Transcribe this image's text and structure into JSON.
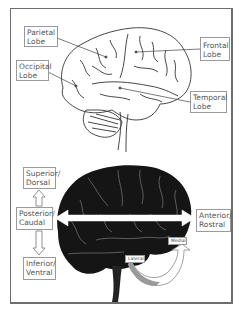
{
  "top_diagram": {
    "title": "Brain lobes (lateral view)",
    "labels": {
      "parietal": {
        "line1": "Parietal",
        "line2": "Lobe"
      },
      "occipital": {
        "line1": "Occipital",
        "line2": "Lobe"
      },
      "frontal": {
        "line1": "Frontal",
        "line2": "Lobe"
      },
      "temporal": {
        "line1": "Temporal",
        "line2": "Lobe"
      }
    }
  },
  "bottom_diagram": {
    "title": "Anatomical directions",
    "labels": {
      "superior": {
        "line1": "Superior/",
        "line2": "Dorsal"
      },
      "posterior": {
        "line1": "Posterior/",
        "line2": "Caudal"
      },
      "inferior": {
        "line1": "Inferior/",
        "line2": "Ventral"
      },
      "anterior": {
        "line1": "Anterior/",
        "line2": "Rostral"
      },
      "lateral": "Lateral",
      "medial": "Medial"
    }
  },
  "colors": {
    "frame": "#6d6d6d",
    "label_border": "#9a9a9a",
    "brain_fill_dark": "#151515",
    "brain_outline": "#333333",
    "arrow_fill": "#ffffff",
    "lateral_arrow": "#9a9a9a"
  }
}
